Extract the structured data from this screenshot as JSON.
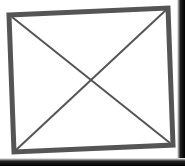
{
  "image": {
    "type": "broken-image-placeholder",
    "icon": "image-placeholder-x-icon",
    "colors": {
      "frame": "#555555",
      "fill": "#ffffff",
      "background_edge": "#000000"
    }
  }
}
